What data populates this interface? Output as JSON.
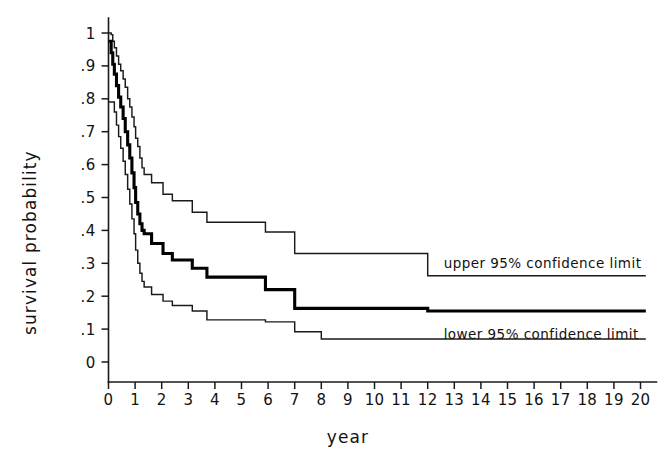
{
  "chart_data": {
    "type": "line",
    "title": "",
    "xlabel": "year",
    "ylabel": "survival probability",
    "xlim": [
      0,
      20
    ],
    "ylim": [
      0,
      1
    ],
    "grid": false,
    "legend_position": "inline-right",
    "x_ticks": [
      "0",
      "1",
      "2",
      "3",
      "4",
      "5",
      "6",
      "7",
      "8",
      "9",
      "10",
      "11",
      "12",
      "13",
      "14",
      "15",
      "16",
      "17",
      "18",
      "19",
      "20"
    ],
    "y_ticks": [
      "0",
      ".1",
      ".2",
      ".3",
      ".4",
      ".5",
      ".6",
      ".7",
      ".8",
      ".9",
      "1"
    ],
    "annotations": [
      {
        "text": "upper 95% confidence limit",
        "x": 12.6,
        "y": 0.3
      },
      {
        "text": "lower 95% confidence limit",
        "x": 12.6,
        "y": 0.085
      }
    ],
    "series": [
      {
        "name": "upper 95% confidence limit",
        "style": "step",
        "linewidth": "thin",
        "points": [
          [
            0.0,
            1.0
          ],
          [
            0.06,
            1.0
          ],
          [
            0.1,
            0.995
          ],
          [
            0.16,
            0.975
          ],
          [
            0.22,
            0.955
          ],
          [
            0.3,
            0.93
          ],
          [
            0.38,
            0.905
          ],
          [
            0.46,
            0.885
          ],
          [
            0.55,
            0.86
          ],
          [
            0.63,
            0.835
          ],
          [
            0.72,
            0.8
          ],
          [
            0.8,
            0.775
          ],
          [
            0.88,
            0.745
          ],
          [
            0.96,
            0.715
          ],
          [
            1.02,
            0.68
          ],
          [
            1.1,
            0.655
          ],
          [
            1.18,
            0.62
          ],
          [
            1.26,
            0.59
          ],
          [
            1.34,
            0.57
          ],
          [
            1.6,
            0.57
          ],
          [
            1.62,
            0.545
          ],
          [
            2.0,
            0.545
          ],
          [
            2.05,
            0.51
          ],
          [
            2.35,
            0.51
          ],
          [
            2.4,
            0.49
          ],
          [
            3.1,
            0.49
          ],
          [
            3.15,
            0.455
          ],
          [
            3.65,
            0.455
          ],
          [
            3.7,
            0.425
          ],
          [
            5.85,
            0.425
          ],
          [
            5.9,
            0.395
          ],
          [
            6.95,
            0.395
          ],
          [
            7.0,
            0.33
          ],
          [
            11.95,
            0.33
          ],
          [
            12.0,
            0.262
          ],
          [
            20.2,
            0.262
          ]
        ]
      },
      {
        "name": "survival estimate",
        "style": "step",
        "linewidth": "bold",
        "points": [
          [
            0.0,
            0.975
          ],
          [
            0.06,
            0.975
          ],
          [
            0.1,
            0.94
          ],
          [
            0.16,
            0.905
          ],
          [
            0.22,
            0.875
          ],
          [
            0.3,
            0.84
          ],
          [
            0.38,
            0.805
          ],
          [
            0.46,
            0.775
          ],
          [
            0.55,
            0.74
          ],
          [
            0.63,
            0.7
          ],
          [
            0.72,
            0.66
          ],
          [
            0.8,
            0.62
          ],
          [
            0.88,
            0.575
          ],
          [
            0.96,
            0.53
          ],
          [
            1.02,
            0.485
          ],
          [
            1.1,
            0.45
          ],
          [
            1.18,
            0.42
          ],
          [
            1.26,
            0.4
          ],
          [
            1.34,
            0.39
          ],
          [
            1.6,
            0.39
          ],
          [
            1.62,
            0.36
          ],
          [
            2.0,
            0.36
          ],
          [
            2.05,
            0.33
          ],
          [
            2.35,
            0.33
          ],
          [
            2.4,
            0.31
          ],
          [
            3.1,
            0.31
          ],
          [
            3.15,
            0.285
          ],
          [
            3.65,
            0.285
          ],
          [
            3.7,
            0.258
          ],
          [
            5.85,
            0.258
          ],
          [
            5.9,
            0.22
          ],
          [
            6.95,
            0.22
          ],
          [
            7.0,
            0.163
          ],
          [
            11.95,
            0.163
          ],
          [
            12.0,
            0.155
          ],
          [
            20.2,
            0.155
          ]
        ]
      },
      {
        "name": "lower 95% confidence limit",
        "style": "step",
        "linewidth": "thin",
        "points": [
          [
            0.0,
            0.79
          ],
          [
            0.16,
            0.79
          ],
          [
            0.22,
            0.76
          ],
          [
            0.3,
            0.72
          ],
          [
            0.38,
            0.685
          ],
          [
            0.46,
            0.65
          ],
          [
            0.55,
            0.61
          ],
          [
            0.63,
            0.57
          ],
          [
            0.72,
            0.525
          ],
          [
            0.8,
            0.48
          ],
          [
            0.88,
            0.435
          ],
          [
            0.96,
            0.39
          ],
          [
            1.02,
            0.34
          ],
          [
            1.1,
            0.3
          ],
          [
            1.18,
            0.27
          ],
          [
            1.26,
            0.245
          ],
          [
            1.34,
            0.228
          ],
          [
            1.6,
            0.228
          ],
          [
            1.62,
            0.205
          ],
          [
            2.0,
            0.205
          ],
          [
            2.05,
            0.185
          ],
          [
            2.35,
            0.185
          ],
          [
            2.4,
            0.172
          ],
          [
            3.1,
            0.172
          ],
          [
            3.15,
            0.155
          ],
          [
            3.65,
            0.155
          ],
          [
            3.7,
            0.128
          ],
          [
            5.85,
            0.128
          ],
          [
            5.9,
            0.122
          ],
          [
            6.95,
            0.122
          ],
          [
            7.0,
            0.092
          ],
          [
            7.95,
            0.092
          ],
          [
            8.0,
            0.07
          ],
          [
            20.2,
            0.07
          ]
        ]
      }
    ]
  }
}
